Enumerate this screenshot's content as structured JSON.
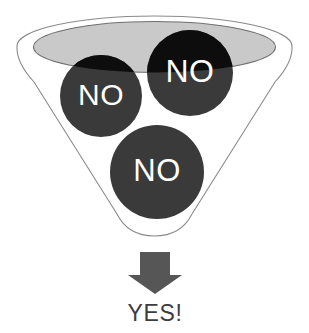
{
  "diagram": {
    "type": "funnel",
    "background_color": "#ffffff",
    "funnel": {
      "name": "funnel-shape",
      "outline_color": "#8a8a8a",
      "body_fill": "#ffffff",
      "rim_band_fill": "#ffffff",
      "inner_ellipse_fill": "#c9c9c9",
      "inner_ellipse_outline": "#6f6f6f"
    },
    "balls": [
      {
        "id": "ball-left",
        "label": "NO",
        "fill_inside_funnel": "#0d0d0d",
        "fill_below_rim": "#3a3a3a",
        "text_color": "#ffffff",
        "cx": 101,
        "cy": 96,
        "r": 41
      },
      {
        "id": "ball-right",
        "label": "NO",
        "fill_inside_funnel": "#0d0d0d",
        "fill_below_rim": "#3a3a3a",
        "text_color": "#ffffff",
        "cx": 190,
        "cy": 73,
        "r": 43
      },
      {
        "id": "ball-bottom",
        "label": "NO",
        "fill_inside_funnel": "#3a3a3a",
        "fill_below_rim": "#3a3a3a",
        "text_color": "#ffffff",
        "cx": 157,
        "cy": 172,
        "r": 47
      }
    ],
    "arrow": {
      "name": "down-arrow",
      "color": "#565656",
      "direction": "down"
    },
    "outcome": {
      "name": "outcome-label",
      "text": "YES!",
      "color": "#3d3d3d",
      "font_size": 23
    }
  }
}
